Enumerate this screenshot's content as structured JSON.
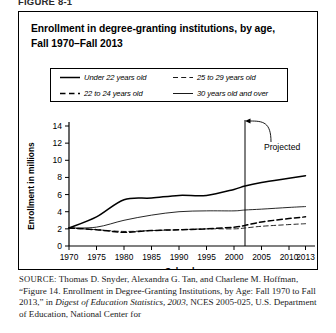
{
  "figure_label": "FIGURE 8-1",
  "figure": {
    "title_line1": "Enrollment in degree-granting institutions, by age,",
    "title_line2": "Fall 1970–Fall 2013"
  },
  "legend": {
    "entries": [
      {
        "label": "Under 22 years old",
        "style": "solid",
        "width": "thick",
        "icon": "solid-line-icon"
      },
      {
        "label": "25 to 29 years old",
        "style": "dashed",
        "width": "thin",
        "icon": "dashed-line-icon"
      },
      {
        "label": "22 to 24 years old",
        "style": "dashed",
        "width": "thick",
        "icon": "dashed-line-icon"
      },
      {
        "label": "30 years old and over",
        "style": "solid",
        "width": "thin",
        "icon": "solid-line-icon"
      }
    ]
  },
  "annotation": {
    "projected_label": "Projected",
    "projected_year": 2002
  },
  "source": {
    "prefix": "SOURCE:",
    "text_1": " Thomas D. Snyder, Alexandra G. Tan, and Charlene M. Hoffman, “Figure 14. Enrollment in Degree-Granting Institutions, by Age: Fall 1970 to Fall 2013,” in ",
    "italic_1": "Digest of Education Statistics, 2003",
    "text_2": ", NCES 2005-025, U.S. Department of Education, National Center for"
  },
  "chart_data": {
    "type": "line",
    "title": "Enrollment in degree-granting institutions, by age, Fall 1970–Fall 2013",
    "xlabel": "School year",
    "ylabel": "Enrollment in millions",
    "xlim": [
      1970,
      2014
    ],
    "ylim": [
      0,
      14
    ],
    "ytick_values": [
      0,
      2,
      4,
      6,
      8,
      10,
      12,
      14
    ],
    "ytick_labels": [
      "0",
      "2",
      "4",
      "6",
      "8",
      "10",
      "12",
      "14"
    ],
    "xtick_values": [
      1970,
      1975,
      1980,
      1985,
      1990,
      1995,
      2000,
      2005,
      2010,
      2013
    ],
    "xtick_labels": [
      "1970",
      "1975",
      "1980",
      "1985",
      "1990",
      "1995",
      "2000",
      "2005",
      "2010",
      "2013"
    ],
    "grid": false,
    "legend_position": "above-plot",
    "annotations": [
      {
        "text": "Projected",
        "type": "vertical-divider-with-arrow",
        "x": 2002
      }
    ],
    "x": [
      1970,
      1975,
      1980,
      1985,
      1990,
      1995,
      2000,
      2002,
      2005,
      2010,
      2013
    ],
    "series": [
      {
        "name": "Under 22 years old",
        "style": "solid",
        "width": "thick",
        "values": [
          2.1,
          3.4,
          5.4,
          5.6,
          5.9,
          5.9,
          6.6,
          7.0,
          7.4,
          7.9,
          8.2
        ]
      },
      {
        "name": "22 to 24 years old",
        "style": "dashed",
        "width": "thick",
        "values": [
          2.1,
          1.9,
          1.6,
          1.8,
          1.9,
          2.0,
          2.2,
          2.4,
          2.8,
          3.2,
          3.4
        ]
      },
      {
        "name": "25 to 29 years old",
        "style": "dashed",
        "width": "thin",
        "values": [
          2.1,
          1.9,
          1.7,
          1.8,
          1.9,
          2.0,
          2.0,
          2.1,
          2.3,
          2.5,
          2.6
        ]
      },
      {
        "name": "30 years old and over",
        "style": "solid",
        "width": "thin",
        "values": [
          2.1,
          2.2,
          3.0,
          3.6,
          4.0,
          4.1,
          4.1,
          4.2,
          4.3,
          4.5,
          4.6
        ]
      }
    ]
  }
}
